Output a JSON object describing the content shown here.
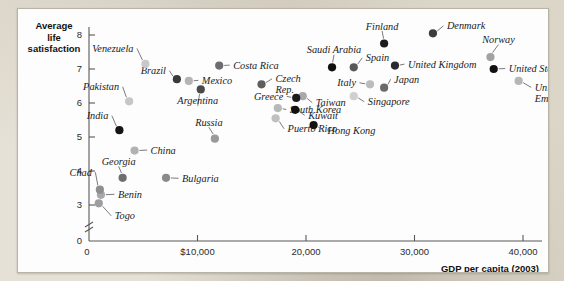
{
  "figure": {
    "y_axis_title": "Average\nlife\nsatisfaction",
    "y_axis_title_lines": [
      "Average",
      "life",
      "satisfaction"
    ],
    "x_axis_title": "GDP per capita (2003)",
    "axis_break_note": "y-axis broken between 0 and 3"
  },
  "chart_data": {
    "type": "scatter",
    "title": "",
    "subtitle": "",
    "xlabel": "GDP per capita (2003)",
    "ylabel": "Average life satisfaction",
    "xlim": [
      0,
      44000
    ],
    "ylim": [
      2.8,
      8.3
    ],
    "xticks": [
      0,
      10000,
      20000,
      30000,
      40000
    ],
    "xticklabels": [
      "0",
      "$10,000",
      "20,000",
      "30,000",
      "40,000"
    ],
    "yticks": [
      0,
      3,
      4,
      5,
      6,
      7,
      8
    ],
    "yticklabels": [
      "0",
      "3",
      "4",
      "5",
      "6",
      "7",
      "8"
    ],
    "y_axis_break": true,
    "grid": false,
    "legend": "none",
    "points": [
      {
        "name": "Togo",
        "x": 900,
        "y": 3.05,
        "shade": "#9d9d9f",
        "label_dx": 16,
        "label_dy": 16,
        "anchor": "r"
      },
      {
        "name": "Benin",
        "x": 1100,
        "y": 3.3,
        "shade": "#a8a8aa",
        "label_dx": 17,
        "label_dy": 3,
        "anchor": "r"
      },
      {
        "name": "Chad",
        "x": 1000,
        "y": 3.45,
        "shade": "#8e8e90",
        "label_dx": -8,
        "label_dy": -14,
        "anchor": "l"
      },
      {
        "name": "Georgia",
        "x": 3100,
        "y": 3.8,
        "shade": "#6e6e70",
        "label_dx": -4,
        "label_dy": -13,
        "anchor": "c"
      },
      {
        "name": "Bulgaria",
        "x": 7100,
        "y": 3.8,
        "shade": "#8a8a8c",
        "label_dx": 16,
        "label_dy": 4,
        "anchor": "r"
      },
      {
        "name": "China",
        "x": 4200,
        "y": 4.6,
        "shade": "#b2b2b4",
        "label_dx": 16,
        "label_dy": 3,
        "anchor": "r"
      },
      {
        "name": "India",
        "x": 2800,
        "y": 5.2,
        "shade": "#151515",
        "label_dx": -11,
        "label_dy": -11,
        "anchor": "l"
      },
      {
        "name": "Russia",
        "x": 11600,
        "y": 4.95,
        "shade": "#9a9a9c",
        "label_dx": -6,
        "label_dy": -13,
        "anchor": "c"
      },
      {
        "name": "Puerto Rico",
        "x": 17200,
        "y": 5.55,
        "shade": "#c0c0c2",
        "label_dx": 12,
        "label_dy": 14,
        "anchor": "r"
      },
      {
        "name": "South Korea",
        "x": 17400,
        "y": 5.85,
        "shade": "#b8b8ba",
        "label_dx": 12,
        "label_dy": 5,
        "anchor": "r"
      },
      {
        "name": "Pakistan",
        "x": 3700,
        "y": 6.05,
        "shade": "#c6c6c8",
        "label_dx": -10,
        "label_dy": -11,
        "anchor": "l"
      },
      {
        "name": "Taiwan",
        "x": 19700,
        "y": 6.2,
        "shade": "#a9a9ab",
        "label_dx": 13,
        "label_dy": 10,
        "anchor": "r"
      },
      {
        "name": "Greece",
        "x": 19100,
        "y": 6.15,
        "shade": "#1b1b1b",
        "label_dx": -13,
        "label_dy": 2,
        "anchor": "l"
      },
      {
        "name": "Argentina",
        "x": 10300,
        "y": 6.4,
        "shade": "#4a4a4c",
        "label_dx": -3,
        "label_dy": 15,
        "anchor": "c"
      },
      {
        "name": "Czech Rep.",
        "x": 15900,
        "y": 6.55,
        "shade": "#5e5e60",
        "label_dx": 14,
        "label_dy": -2,
        "anchor": "r"
      },
      {
        "name": "Mexico",
        "x": 9200,
        "y": 6.65,
        "shade": "#b4b4b6",
        "label_dx": 13,
        "label_dy": 3,
        "anchor": "r"
      },
      {
        "name": "Brazil",
        "x": 8100,
        "y": 6.7,
        "shade": "#3a3a3c",
        "label_dx": -11,
        "label_dy": -5,
        "anchor": "l"
      },
      {
        "name": "Italy",
        "x": 25900,
        "y": 6.55,
        "shade": "#bcbcbe",
        "label_dx": -14,
        "label_dy": 2,
        "anchor": "l"
      },
      {
        "name": "Japan",
        "x": 27200,
        "y": 6.45,
        "shade": "#6a6a6c",
        "label_dx": 10,
        "label_dy": -5,
        "anchor": "r"
      },
      {
        "name": "Kuwait",
        "x": 19000,
        "y": 5.8,
        "shade": "#111111",
        "label_dx": 13,
        "label_dy": 9,
        "anchor": "r"
      },
      {
        "name": "Hong Kong",
        "x": 20700,
        "y": 5.35,
        "shade": "#121212",
        "label_dx": 14,
        "label_dy": 9,
        "anchor": "r"
      },
      {
        "name": "Singapore",
        "x": 24400,
        "y": 6.2,
        "shade": "#d0d0d2",
        "label_dx": 14,
        "label_dy": 9,
        "anchor": "r"
      },
      {
        "name": "Costa Rica",
        "x": 12000,
        "y": 7.1,
        "shade": "#6c6c6e",
        "label_dx": 14,
        "label_dy": 3,
        "anchor": "r"
      },
      {
        "name": "Venezuela",
        "x": 5200,
        "y": 7.15,
        "shade": "#c8c8ca",
        "label_dx": -12,
        "label_dy": -12,
        "anchor": "l"
      },
      {
        "name": "Saudi Arabia",
        "x": 22400,
        "y": 7.05,
        "shade": "#101010",
        "label_dx": 2,
        "label_dy": -14,
        "anchor": "c"
      },
      {
        "name": "Spain",
        "x": 24400,
        "y": 7.05,
        "shade": "#58585a",
        "label_dx": 12,
        "label_dy": -6,
        "anchor": "r"
      },
      {
        "name": "United Kingdom",
        "x": 28200,
        "y": 7.1,
        "shade": "#2a2a2c",
        "label_dx": 13,
        "label_dy": 2,
        "anchor": "r"
      },
      {
        "name": "Finland",
        "x": 27200,
        "y": 7.75,
        "shade": "#1c1c1e",
        "label_dx": -2,
        "label_dy": -14,
        "anchor": "c"
      },
      {
        "name": "Denmark",
        "x": 31700,
        "y": 8.05,
        "shade": "#3c3c3e",
        "label_dx": 14,
        "label_dy": -4,
        "anchor": "r"
      },
      {
        "name": "Norway",
        "x": 37000,
        "y": 7.35,
        "shade": "#a2a2a4",
        "label_dx": 8,
        "label_dy": -14,
        "anchor": "c"
      },
      {
        "name": "United States",
        "x": 37300,
        "y": 7.0,
        "shade": "#111111",
        "label_dx": 15,
        "label_dy": 3,
        "anchor": "r"
      },
      {
        "name": "United Arab Emirates",
        "x": 39600,
        "y": 6.65,
        "shade": "#b6b6b8",
        "label_dx": 16,
        "label_dy": 10,
        "anchor": "r"
      }
    ],
    "multiline_labels": {
      "Czech Rep.": [
        "Czech",
        "Rep."
      ],
      "United Arab Emirates": [
        "United Arab",
        "Emirates"
      ]
    }
  }
}
